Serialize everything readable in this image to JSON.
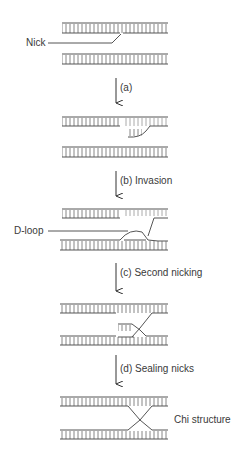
{
  "diagram": {
    "labels": {
      "nick": "Nick",
      "step_a": "(a)",
      "step_b": "(b) Invasion",
      "d_loop": "D-loop",
      "step_c": "(c) Second nicking",
      "step_d": "(d) Sealing nicks",
      "chi": "Chi structure"
    },
    "stroke_color": "#555555",
    "stages": [
      {
        "id": "stage-1",
        "description": "Two DNA duplexes, top duplex nicked"
      },
      {
        "id": "stage-2",
        "description": "Nicked strand unwinds"
      },
      {
        "id": "stage-3",
        "description": "Strand invades lower duplex forming D-loop"
      },
      {
        "id": "stage-4",
        "description": "Second nick in displaced strand"
      },
      {
        "id": "stage-5",
        "description": "Nicks sealed forming Chi structure"
      }
    ]
  }
}
